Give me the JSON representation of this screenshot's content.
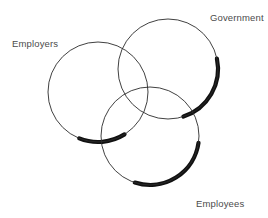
{
  "diagram": {
    "type": "venn-3-circle",
    "title": "",
    "background_color": "#ffffff",
    "stroke_color": "#2b2b2b",
    "shadow_color": "#111111",
    "label_color": "#4b4b4b",
    "thin_stroke_width": 0.9,
    "thick_stroke_width": 4.2,
    "circles": [
      {
        "id": "employers",
        "label": "Employers",
        "cx": 98,
        "cy": 92,
        "r": 50,
        "shadow_arc_start_deg": 58,
        "shadow_arc_end_deg": 112
      },
      {
        "id": "government",
        "label": "Government",
        "cx": 168,
        "cy": 69,
        "r": 50,
        "shadow_arc_start_deg": -12,
        "shadow_arc_end_deg": 72
      },
      {
        "id": "employees",
        "label": "Employees",
        "cx": 150,
        "cy": 136,
        "r": 49,
        "shadow_arc_start_deg": 8,
        "shadow_arc_end_deg": 108
      }
    ],
    "labels": {
      "employers": "Employers",
      "government": "Government",
      "employees": "Employees"
    }
  }
}
